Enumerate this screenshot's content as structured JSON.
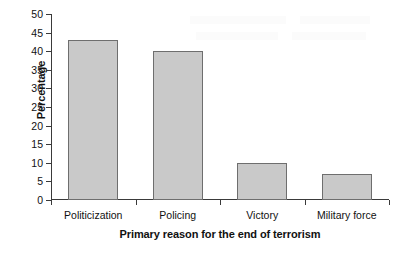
{
  "chart_data": {
    "type": "bar",
    "title": "",
    "subtitle": "",
    "xlabel": "Primary reason for the end of terrorism",
    "ylabel": "Percentage",
    "categories": [
      "Politicization",
      "Policing",
      "Victory",
      "Military force"
    ],
    "values": [
      43,
      40,
      10,
      7
    ],
    "series": [
      {
        "name": "Percentage",
        "values": [
          43,
          40,
          10,
          7
        ]
      }
    ],
    "ylim": [
      0,
      50
    ],
    "y_ticks": [
      0,
      5,
      10,
      15,
      20,
      25,
      30,
      35,
      40,
      45,
      50
    ],
    "y_tick_labels": [
      "0",
      "5",
      "10",
      "15",
      "20",
      "25",
      "30",
      "35",
      "40",
      "45",
      "50"
    ],
    "grid": false,
    "legend": false,
    "legend_position": "none",
    "bar_fill_color": "#c9c9c9",
    "bar_edge_color": "#6e6e6e",
    "axis_color": "#3a3a3a",
    "background_color": "#ffffff"
  }
}
